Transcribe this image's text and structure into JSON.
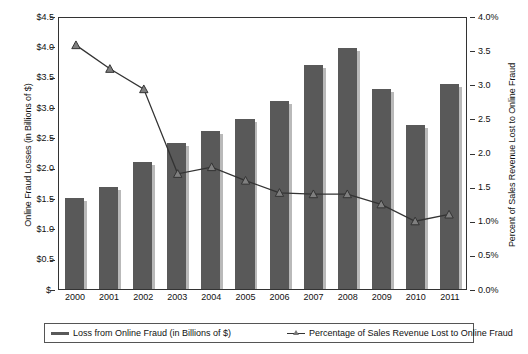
{
  "chart_data": {
    "type": "bar",
    "title": "",
    "subtitle": "",
    "xlabel": "",
    "ylabel": "Online Fraud Losses (in Billions of $)",
    "y2label": "Percent of Sales Revenue Lost to Online Fraud",
    "grid": false,
    "legend_position": "bottom",
    "categories": [
      "2000",
      "2001",
      "2002",
      "2003",
      "2004",
      "2005",
      "2006",
      "2007",
      "2008",
      "2009",
      "2010",
      "2011"
    ],
    "ylim": [
      0,
      4.5
    ],
    "y2lim": [
      0,
      4.0
    ],
    "y_ticks": [
      0,
      0.5,
      1.0,
      1.5,
      2.0,
      2.5,
      3.0,
      3.5,
      4.0,
      4.5
    ],
    "y_tick_labels": [
      "$-",
      "$0.5",
      "$1.0",
      "$1.5",
      "$2.0",
      "$2.5",
      "$3.0",
      "$3.5",
      "$4.0",
      "$4.5"
    ],
    "y2_ticks": [
      0,
      0.5,
      1.0,
      1.5,
      2.0,
      2.5,
      3.0,
      3.5,
      4.0
    ],
    "y2_tick_labels": [
      "0.0%",
      "0.5%",
      "1.0%",
      "1.5",
      "2.0",
      "2.5",
      "3.0",
      "3.5",
      "4.0%"
    ],
    "series": [
      {
        "name": "Loss from Online Fraud (in Billions of $)",
        "type": "bar",
        "axis": "left",
        "color": "#595959",
        "values": [
          1.5,
          1.68,
          2.1,
          2.4,
          2.6,
          2.8,
          3.1,
          3.7,
          3.98,
          3.3,
          2.7,
          3.38
        ]
      },
      {
        "name": "Percentage of Sales Revenue Lost to Online Fraud",
        "type": "line",
        "axis": "right",
        "color": "#333333",
        "marker": "triangle",
        "values": [
          3.6,
          3.25,
          2.95,
          1.7,
          1.8,
          1.6,
          1.42,
          1.4,
          1.4,
          1.25,
          1.0,
          1.1
        ]
      }
    ]
  },
  "axes": {
    "left_title": "Online Fraud Losses (in Billions of $)",
    "right_title": "Percent of Sales Revenue Lost to Online Fraud"
  },
  "legend": {
    "items": [
      {
        "label": "Loss from Online Fraud (in Billions of $)"
      },
      {
        "label": "Percentage of Sales Revenue Lost to Online Fraud"
      }
    ]
  },
  "colors": {
    "bar": "#595959",
    "bar_shadow": "#b9b9b9",
    "line": "#333333",
    "marker_fill": "#7f7f7f",
    "axis": "#333333",
    "background": "#ffffff"
  }
}
